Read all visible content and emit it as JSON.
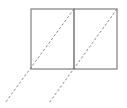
{
  "diagram": {
    "type": "two-square-grid-with-dashed-diagonals",
    "colors": {
      "box_stroke": "#8a8a8a",
      "dash_stroke": "#7a7a7a",
      "background": "#ffffff"
    },
    "boxes": [
      {
        "x": 31,
        "y": 9,
        "w": 43,
        "h": 60
      },
      {
        "x": 74,
        "y": 9,
        "w": 43,
        "h": 60
      }
    ],
    "dashed_lines": [
      {
        "x1": 74,
        "y1": 9,
        "x2": 5,
        "y2": 103
      },
      {
        "x1": 117,
        "y1": 9,
        "x2": 49,
        "y2": 103
      }
    ]
  }
}
